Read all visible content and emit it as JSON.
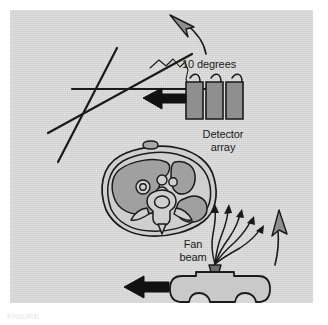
{
  "figure": {
    "panel_background": "#d6d6d6",
    "ink_color": "#1a1a1a",
    "fill_gray": "#9a9a9a",
    "tissue_gray": "#a9a9a9",
    "page_background": "#ffffff"
  },
  "labels": {
    "angle": "10 degrees",
    "detector_array": "Detector\narray",
    "fan_beam": "Fan\nbeam"
  },
  "caption": {
    "text": "FIGURE"
  },
  "components": {
    "detector_array": {
      "name": "detector-array",
      "block_count": 3,
      "wire_count": 3
    },
    "fan_beam": {
      "name": "fan-beam",
      "ray_count": 5,
      "ray_style": "wavy"
    },
    "xray_tube": {
      "name": "xray-tube-housing"
    },
    "patient_slice": {
      "name": "abdominal-cross-section",
      "structures": [
        "body wall",
        "liver",
        "stomach",
        "vessels",
        "vertebra",
        "spinal canal"
      ]
    },
    "arrows": [
      {
        "name": "detector-translation-arrow",
        "direction": "left"
      },
      {
        "name": "tube-translation-arrow",
        "direction": "left"
      },
      {
        "name": "rotation-arrow-top",
        "direction": "up-left",
        "curved": true
      },
      {
        "name": "rotation-arrow-right",
        "direction": "up",
        "curved": true
      }
    ],
    "angle_lines": {
      "name": "rotation-angle-lines",
      "line_count": 3
    }
  }
}
